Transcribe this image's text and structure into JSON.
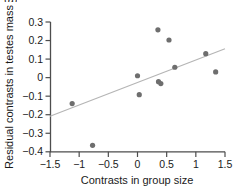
{
  "figure": {
    "panel_label": "(a)",
    "background_color": "#ffffff"
  },
  "chart_data": {
    "type": "scatter",
    "title": "",
    "xlabel": "Contrasts in group size",
    "ylabel": "Residual contrasts in testes mass",
    "xlim": [
      -1.5,
      1.5
    ],
    "ylim": [
      -0.4,
      0.3
    ],
    "xticks": [
      -1.5,
      -1,
      -0.5,
      0,
      0.5,
      1,
      1.5
    ],
    "xticklabels": [
      "−1.5",
      "−1",
      "−0.5",
      "0",
      "0.5",
      "1",
      "1.5"
    ],
    "yticks": [
      0.3,
      0.2,
      0.1,
      0,
      -0.1,
      -0.2,
      -0.3,
      -0.4
    ],
    "yticklabels": [
      "0.3",
      "0.2",
      "0.1",
      "0",
      "−0.1",
      "−0.2",
      "−0.3",
      "−0.4"
    ],
    "grid": false,
    "legend": null,
    "marker_color": "#6e6e6e",
    "marker_size": 5.2,
    "line_color": "#b5b5b5",
    "axis_color": "#4d4d4d",
    "points": [
      {
        "x": -1.12,
        "y": -0.14
      },
      {
        "x": -0.77,
        "y": -0.365
      },
      {
        "x": 0.0,
        "y": 0.01
      },
      {
        "x": 0.03,
        "y": -0.092
      },
      {
        "x": 0.35,
        "y": 0.258
      },
      {
        "x": 0.36,
        "y": -0.022
      },
      {
        "x": 0.4,
        "y": -0.032
      },
      {
        "x": 0.54,
        "y": 0.203
      },
      {
        "x": 0.64,
        "y": 0.056
      },
      {
        "x": 1.17,
        "y": 0.129
      },
      {
        "x": 1.34,
        "y": 0.031
      }
    ],
    "trendline": {
      "type": "linear",
      "x_start": -1.5,
      "y_start": -0.208,
      "x_end": 1.5,
      "y_end": 0.156
    }
  }
}
